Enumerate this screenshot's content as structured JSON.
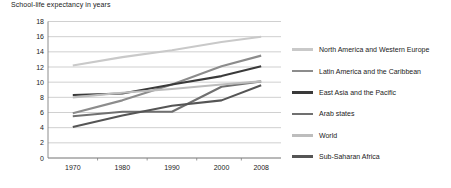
{
  "chart_data": {
    "type": "line",
    "title": "School-life expectancy in years",
    "xlabel": "",
    "ylabel": "",
    "x": [
      1970,
      1980,
      1990,
      2000,
      2008
    ],
    "xtick_labels": [
      "1970",
      "1980",
      "1990",
      "2000",
      "2008"
    ],
    "ytick_labels": [
      "0",
      "2",
      "4",
      "6",
      "8",
      "10",
      "12",
      "14",
      "16",
      "18"
    ],
    "yticks": [
      0,
      2,
      4,
      6,
      8,
      10,
      12,
      14,
      16,
      18
    ],
    "ylim": [
      0,
      18
    ],
    "xlim": [
      1965,
      2012
    ],
    "grid": "horizontal",
    "legend_position": "right",
    "series": [
      {
        "name": "North America and Western Europe",
        "color": "#c9c9c9",
        "values": [
          12.2,
          13.3,
          14.2,
          15.3,
          16.0
        ]
      },
      {
        "name": "Latin America and the Caribbean",
        "color": "#8c8c8c",
        "values": [
          5.9,
          7.6,
          9.7,
          12.1,
          13.5
        ]
      },
      {
        "name": "East Asia and the Pacific",
        "color": "#3a3a3a",
        "values": [
          8.3,
          8.5,
          9.7,
          10.8,
          12.1
        ]
      },
      {
        "name": "Arab states",
        "color": "#707070",
        "values": [
          5.5,
          6.1,
          6.1,
          9.4,
          10.1
        ]
      },
      {
        "name": "World",
        "color": "#bdbdbd",
        "values": [
          8.0,
          8.6,
          9.1,
          9.7,
          10.1
        ]
      },
      {
        "name": "Sub-Saharan Africa",
        "color": "#555555",
        "values": [
          4.1,
          5.6,
          6.9,
          7.6,
          9.6
        ]
      }
    ]
  },
  "axes": {
    "axis_color": "#808080",
    "grid_color": "#b0b0b0"
  }
}
